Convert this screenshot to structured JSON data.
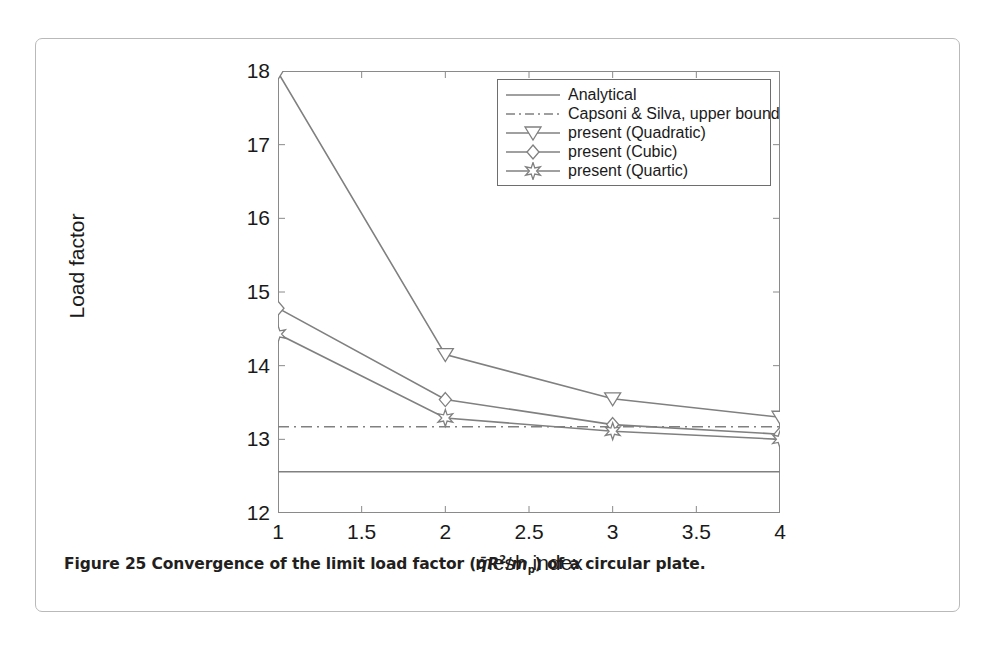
{
  "caption": {
    "prefix": "Figure 25",
    "text_before": "Convergence of the limit load factor (",
    "formula_q": "q̄",
    "formula_R": "R",
    "formula_R_exp": "2",
    "formula_slash": "/",
    "formula_m": "m",
    "formula_m_sub": "p",
    "text_after": ") of a circular plate.",
    "full": "Figure 25 Convergence of the limit load factor (q̄R2/mp) of a circular plate."
  },
  "colors": {
    "line": "#808080",
    "axis": "#8a8a8a",
    "text": "#1a1a1a",
    "card_border": "#b9b9b9",
    "legend_border": "#6e6e6e",
    "background": "#ffffff"
  },
  "chart_data": {
    "type": "line",
    "title": "",
    "xlabel": "mesh index",
    "ylabel": "Load factor",
    "xlim": [
      1,
      4
    ],
    "ylim": [
      12,
      18
    ],
    "xticks": [
      1,
      1.5,
      2,
      2.5,
      3,
      3.5,
      4
    ],
    "xticklabels": [
      "1",
      "1.5",
      "2",
      "2.5",
      "3",
      "3.5",
      "4"
    ],
    "yticks": [
      12,
      13,
      14,
      15,
      16,
      17,
      18
    ],
    "yticklabels": [
      "12",
      "13",
      "14",
      "15",
      "16",
      "17",
      "18"
    ],
    "grid": false,
    "legend_position": "upper right",
    "x": [
      1,
      2,
      3,
      4
    ],
    "series": [
      {
        "name": "Analytical",
        "style": "solid",
        "marker": "none",
        "type": "horizontal-reference",
        "value": 12.56,
        "values": [
          12.56,
          12.56,
          12.56,
          12.56
        ]
      },
      {
        "name": "Capsoni & Silva, upper bound",
        "style": "dashdot",
        "marker": "none",
        "type": "horizontal-reference",
        "value": 13.17,
        "values": [
          13.17,
          13.17,
          13.17,
          13.17
        ]
      },
      {
        "name": "present (Quadratic)",
        "style": "solid",
        "marker": "triangle-down",
        "values": [
          17.98,
          14.15,
          13.55,
          13.3
        ]
      },
      {
        "name": "present (Cubic)",
        "style": "solid",
        "marker": "diamond",
        "values": [
          14.78,
          13.54,
          13.2,
          13.07
        ]
      },
      {
        "name": "present (Quartic)",
        "style": "solid",
        "marker": "star",
        "values": [
          14.43,
          13.29,
          13.11,
          13.0
        ]
      }
    ]
  },
  "legend": {
    "items": [
      {
        "label": "Analytical",
        "marker": "none",
        "style": "solid"
      },
      {
        "label": "Capsoni & Silva, upper bound",
        "marker": "none",
        "style": "dashdot"
      },
      {
        "label": "present (Quadratic)",
        "marker": "triangle-down",
        "style": "solid"
      },
      {
        "label": "present (Cubic)",
        "marker": "diamond",
        "style": "solid"
      },
      {
        "label": "present (Quartic)",
        "marker": "star",
        "style": "solid"
      }
    ]
  }
}
